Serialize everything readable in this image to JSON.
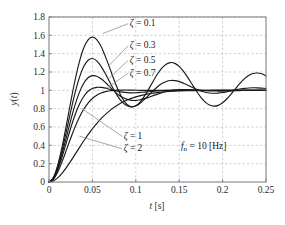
{
  "chart_data": {
    "type": "line",
    "title": "",
    "subtitle": "",
    "xlabel": "t [s]",
    "ylabel": "y(t)",
    "xlim": [
      0,
      0.25
    ],
    "ylim": [
      0,
      1.8
    ],
    "grid": true,
    "legend_position": "inline-annotations",
    "xticks": [
      "0",
      "0.05",
      "0.1",
      "0.15",
      "0.2",
      "0.25"
    ],
    "xtick_values": [
      0,
      0.05,
      0.1,
      0.15,
      0.2,
      0.25
    ],
    "yticks": [
      "0",
      "0.2",
      "0.4",
      "0.6",
      "0.8",
      "1",
      "1.2",
      "1.4",
      "1.6",
      "1.8"
    ],
    "ytick_values": [
      0,
      0.2,
      0.4,
      0.6,
      0.8,
      1.0,
      1.2,
      1.4,
      1.6,
      1.8
    ],
    "annotations": [
      {
        "id": "zeta-0-1",
        "text": "ζ = 0.1",
        "label_x": 0.093,
        "label_y": 1.7,
        "point_x": 0.062,
        "point_y": 1.62
      },
      {
        "id": "zeta-0-3",
        "text": "ζ = 0.3",
        "label_x": 0.093,
        "label_y": 1.46,
        "point_x": 0.068,
        "point_y": 1.26
      },
      {
        "id": "zeta-0-5",
        "text": "ζ = 0.5",
        "label_x": 0.093,
        "label_y": 1.3,
        "point_x": 0.069,
        "point_y": 1.13
      },
      {
        "id": "zeta-0-7",
        "text": "ζ = 0.7",
        "label_x": 0.093,
        "label_y": 1.16,
        "point_x": 0.066,
        "point_y": 1.02
      },
      {
        "id": "zeta-1",
        "text": "ζ = 1",
        "label_x": 0.086,
        "label_y": 0.47,
        "point_x": 0.038,
        "point_y": 0.8
      },
      {
        "id": "zeta-2",
        "text": "ζ = 2",
        "label_x": 0.086,
        "label_y": 0.335,
        "point_x": 0.035,
        "point_y": 0.5
      }
    ],
    "note": "fₙ = 10 [Hz]",
    "note_x": 0.152,
    "note_y": 0.355,
    "natural_frequency_hz": 10,
    "series": [
      {
        "name": "ζ = 0.1",
        "zeta": 0.1,
        "color": "#1a1a1a",
        "peak_time": 0.0503,
        "peak_value": 1.729,
        "x": [
          0,
          0.005,
          0.01,
          0.015,
          0.02,
          0.025,
          0.03,
          0.035,
          0.04,
          0.045,
          0.05,
          0.055,
          0.06,
          0.065,
          0.07,
          0.075,
          0.08,
          0.085,
          0.09,
          0.095,
          0.1,
          0.105,
          0.11,
          0.115,
          0.12,
          0.125,
          0.13,
          0.135,
          0.14,
          0.145,
          0.15,
          0.155,
          0.16,
          0.165,
          0.17,
          0.175,
          0.18,
          0.185,
          0.19,
          0.195,
          0.2,
          0.205,
          0.21,
          0.215,
          0.22,
          0.225,
          0.23,
          0.235,
          0.24,
          0.245,
          0.25
        ],
        "y": [
          0,
          0.048,
          0.182,
          0.381,
          0.621,
          0.873,
          1.11,
          1.311,
          1.461,
          1.551,
          1.58,
          1.552,
          1.477,
          1.368,
          1.242,
          1.113,
          0.997,
          0.905,
          0.845,
          0.82,
          0.831,
          0.872,
          0.937,
          1.016,
          1.1,
          1.178,
          1.242,
          1.285,
          1.303,
          1.294,
          1.261,
          1.207,
          1.139,
          1.064,
          0.99,
          0.924,
          0.872,
          0.839,
          0.827,
          0.836,
          0.864,
          0.908,
          0.962,
          1.02,
          1.076,
          1.125,
          1.161,
          1.183,
          1.189,
          1.18,
          1.157
        ]
      },
      {
        "name": "ζ = 0.3",
        "zeta": 0.3,
        "color": "#1a1a1a",
        "peak_time": 0.0524,
        "peak_value": 1.372,
        "x": [
          0,
          0.005,
          0.01,
          0.015,
          0.02,
          0.025,
          0.03,
          0.035,
          0.04,
          0.045,
          0.05,
          0.055,
          0.06,
          0.065,
          0.07,
          0.075,
          0.08,
          0.085,
          0.09,
          0.095,
          0.1,
          0.105,
          0.11,
          0.115,
          0.12,
          0.125,
          0.13,
          0.135,
          0.14,
          0.145,
          0.15,
          0.155,
          0.16,
          0.165,
          0.17,
          0.175,
          0.18,
          0.185,
          0.19,
          0.195,
          0.2,
          0.205,
          0.21,
          0.215,
          0.22,
          0.225,
          0.23,
          0.235,
          0.24,
          0.245,
          0.25
        ],
        "y": [
          0,
          0.043,
          0.164,
          0.342,
          0.553,
          0.77,
          0.972,
          1.139,
          1.259,
          1.328,
          1.347,
          1.322,
          1.262,
          1.181,
          1.09,
          1.001,
          0.924,
          0.866,
          0.831,
          0.82,
          0.831,
          0.86,
          0.901,
          0.948,
          0.996,
          1.039,
          1.074,
          1.097,
          1.107,
          1.106,
          1.095,
          1.077,
          1.056,
          1.033,
          1.011,
          0.993,
          0.979,
          0.971,
          0.968,
          0.97,
          0.976,
          0.985,
          0.995,
          1.005,
          1.014,
          1.021,
          1.026,
          1.028,
          1.027,
          1.024,
          1.02
        ]
      },
      {
        "name": "ζ = 0.5",
        "zeta": 0.5,
        "color": "#1a1a1a",
        "peak_time": 0.0551,
        "peak_value": 1.163,
        "x": [
          0,
          0.005,
          0.01,
          0.015,
          0.02,
          0.025,
          0.03,
          0.035,
          0.04,
          0.045,
          0.05,
          0.055,
          0.06,
          0.065,
          0.07,
          0.075,
          0.08,
          0.085,
          0.09,
          0.095,
          0.1,
          0.105,
          0.11,
          0.115,
          0.12,
          0.125,
          0.13,
          0.135,
          0.14,
          0.145,
          0.15,
          0.155,
          0.16,
          0.165,
          0.17,
          0.175,
          0.18,
          0.185,
          0.19,
          0.195,
          0.2,
          0.205,
          0.21,
          0.215,
          0.22,
          0.225,
          0.23,
          0.235,
          0.24,
          0.245,
          0.25
        ],
        "y": [
          0,
          0.039,
          0.147,
          0.305,
          0.488,
          0.673,
          0.841,
          0.978,
          1.077,
          1.137,
          1.16,
          1.154,
          1.126,
          1.085,
          1.038,
          0.992,
          0.952,
          0.921,
          0.901,
          0.891,
          0.89,
          0.897,
          0.909,
          0.925,
          0.942,
          0.959,
          0.974,
          0.987,
          0.997,
          1.003,
          1.007,
          1.008,
          1.007,
          1.005,
          1.002,
          0.999,
          0.996,
          0.994,
          0.993,
          0.992,
          0.992,
          0.993,
          0.994,
          0.996,
          0.997,
          0.999,
          1.0,
          1.001,
          1.001,
          1.001,
          1.001
        ]
      },
      {
        "name": "ζ = 0.7",
        "zeta": 0.7,
        "color": "#1a1a1a",
        "peak_time": 0.0594,
        "peak_value": 1.046,
        "x": [
          0,
          0.005,
          0.01,
          0.015,
          0.02,
          0.025,
          0.03,
          0.035,
          0.04,
          0.045,
          0.05,
          0.055,
          0.06,
          0.065,
          0.07,
          0.075,
          0.08,
          0.085,
          0.09,
          0.095,
          0.1,
          0.105,
          0.11,
          0.115,
          0.12,
          0.125,
          0.13,
          0.135,
          0.14,
          0.145,
          0.15,
          0.155,
          0.16,
          0.165,
          0.17,
          0.175,
          0.18,
          0.185,
          0.19,
          0.195,
          0.2,
          0.205,
          0.21,
          0.215,
          0.22,
          0.225,
          0.23,
          0.235,
          0.24,
          0.245,
          0.25
        ],
        "y": [
          0,
          0.035,
          0.131,
          0.271,
          0.43,
          0.589,
          0.731,
          0.847,
          0.933,
          0.99,
          1.021,
          1.033,
          1.032,
          1.024,
          1.012,
          0.999,
          0.988,
          0.98,
          0.975,
          0.973,
          0.974,
          0.977,
          0.981,
          0.985,
          0.989,
          0.993,
          0.996,
          0.999,
          1.001,
          1.002,
          1.003,
          1.003,
          1.003,
          1.002,
          1.002,
          1.001,
          1.001,
          1.0,
          1.0,
          1.0,
          1.0,
          1.0,
          1.0,
          1.0,
          1.0,
          1.0,
          1.0,
          1.0,
          1.0,
          1.0,
          1.0
        ]
      },
      {
        "name": "ζ = 1",
        "zeta": 1.0,
        "color": "#1a1a1a",
        "peak_time": null,
        "peak_value": 1.0,
        "x": [
          0,
          0.005,
          0.01,
          0.015,
          0.02,
          0.025,
          0.03,
          0.035,
          0.04,
          0.045,
          0.05,
          0.055,
          0.06,
          0.065,
          0.07,
          0.075,
          0.08,
          0.085,
          0.09,
          0.095,
          0.1,
          0.11,
          0.12,
          0.13,
          0.14,
          0.15,
          0.16,
          0.17,
          0.18,
          0.19,
          0.2,
          0.21,
          0.22,
          0.23,
          0.24,
          0.25
        ],
        "y": [
          0,
          0.029,
          0.107,
          0.22,
          0.348,
          0.478,
          0.6,
          0.706,
          0.793,
          0.861,
          0.911,
          0.947,
          0.971,
          0.986,
          0.995,
          1.0,
          1.002,
          1.003,
          1.003,
          1.002,
          1.001,
          1.0,
          1.0,
          1.0,
          1.0,
          1.0,
          1.0,
          1.0,
          1.0,
          1.0,
          1.0,
          1.0,
          1.0,
          1.0,
          1.0,
          1.0
        ]
      },
      {
        "name": "ζ = 2",
        "zeta": 2.0,
        "color": "#1a1a1a",
        "peak_time": null,
        "peak_value": 1.0,
        "x": [
          0,
          0.005,
          0.01,
          0.015,
          0.02,
          0.025,
          0.03,
          0.035,
          0.04,
          0.045,
          0.05,
          0.06,
          0.07,
          0.08,
          0.09,
          0.1,
          0.11,
          0.12,
          0.13,
          0.14,
          0.15,
          0.16,
          0.17,
          0.18,
          0.19,
          0.2,
          0.21,
          0.22,
          0.23,
          0.24,
          0.25
        ],
        "y": [
          0,
          0.012,
          0.045,
          0.095,
          0.157,
          0.227,
          0.301,
          0.375,
          0.447,
          0.516,
          0.58,
          0.691,
          0.779,
          0.845,
          0.894,
          0.929,
          0.953,
          0.97,
          0.981,
          0.988,
          0.993,
          0.996,
          0.997,
          0.998,
          0.999,
          0.999,
          1.0,
          1.0,
          1.0,
          1.0,
          1.0
        ]
      }
    ]
  }
}
